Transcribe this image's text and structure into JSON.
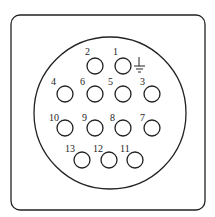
{
  "diagram": {
    "type": "connector-pinout",
    "pin_count": 13,
    "ground_symbol_at_pin": "1",
    "pins": [
      {
        "label": "1",
        "cx": 123,
        "cy": 66,
        "lx": 113,
        "ly": 55
      },
      {
        "label": "2",
        "cx": 95,
        "cy": 66,
        "lx": 85,
        "ly": 55
      },
      {
        "label": "3",
        "cx": 152,
        "cy": 94,
        "lx": 140,
        "ly": 85
      },
      {
        "label": "4",
        "cx": 65,
        "cy": 94,
        "lx": 51,
        "ly": 85
      },
      {
        "label": "5",
        "cx": 123,
        "cy": 94,
        "lx": 108,
        "ly": 85
      },
      {
        "label": "6",
        "cx": 95,
        "cy": 94,
        "lx": 80,
        "ly": 85
      },
      {
        "label": "7",
        "cx": 152,
        "cy": 128,
        "lx": 140,
        "ly": 121
      },
      {
        "label": "8",
        "cx": 123,
        "cy": 128,
        "lx": 110,
        "ly": 121
      },
      {
        "label": "9",
        "cx": 95,
        "cy": 128,
        "lx": 82,
        "ly": 121
      },
      {
        "label": "10",
        "cx": 65,
        "cy": 128,
        "lx": 49,
        "ly": 121
      },
      {
        "label": "11",
        "cx": 135,
        "cy": 160,
        "lx": 120,
        "ly": 152
      },
      {
        "label": "12",
        "cx": 109,
        "cy": 160,
        "lx": 93,
        "ly": 152
      },
      {
        "label": "13",
        "cx": 82,
        "cy": 160,
        "lx": 65,
        "ly": 152
      }
    ]
  }
}
